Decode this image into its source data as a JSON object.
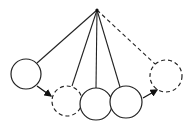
{
  "diagram": {
    "title": "",
    "stroke_color": "#222222",
    "background": "#ffffff",
    "pivot": {
      "x": 97,
      "y": 10
    },
    "balls": [
      {
        "id": "left-raised",
        "cx": 26,
        "cy": 74,
        "r": 15,
        "style": "solid"
      },
      {
        "id": "left-ghost",
        "cx": 67,
        "cy": 101,
        "r": 15,
        "style": "dashed"
      },
      {
        "id": "middle",
        "cx": 96,
        "cy": 104,
        "r": 16,
        "style": "solid"
      },
      {
        "id": "right",
        "cx": 126,
        "cy": 102,
        "r": 16,
        "style": "solid"
      },
      {
        "id": "right-ghost",
        "cx": 166,
        "cy": 76,
        "r": 16,
        "style": "dashed"
      }
    ],
    "arrows": [
      {
        "from": "left-raised",
        "to": "left-ghost"
      },
      {
        "from": "right",
        "to": "right-ghost"
      }
    ]
  }
}
